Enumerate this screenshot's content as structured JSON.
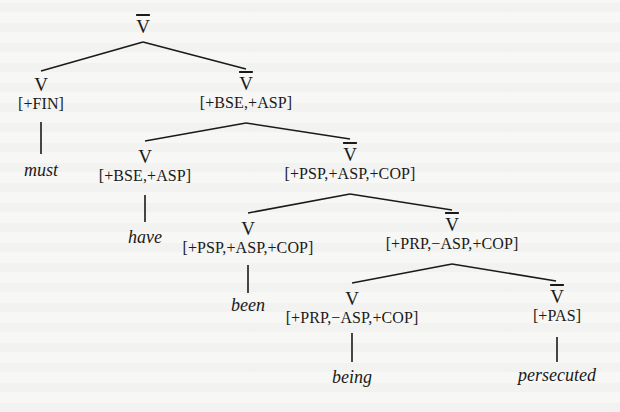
{
  "tree": {
    "root": {
      "category": "V̄",
      "bar": true
    },
    "nodes": {
      "n1": {
        "category": "V",
        "features": "[+FIN]",
        "word": "must"
      },
      "n2": {
        "category": "V̄",
        "features": "[+BSE,+ASP]"
      },
      "n3": {
        "category": "V",
        "features": "[+BSE,+ASP]",
        "word": "have"
      },
      "n4": {
        "category": "V̄",
        "features": "[+PSP,+ASP,+COP]"
      },
      "n5": {
        "category": "V",
        "features": "[+PSP,+ASP,+COP]",
        "word": "been"
      },
      "n6": {
        "category": "V̄",
        "features": "[+PRP,−ASP,+COP]"
      },
      "n7": {
        "category": "V",
        "features": "[+PRP,−ASP,+COP]",
        "word": "being"
      },
      "n8": {
        "category": "V̄",
        "features": "[+PAS]",
        "word": "persecuted"
      }
    },
    "labels": {
      "root_cat": "V",
      "n1_cat": "V",
      "n2_cat": "V",
      "n3_cat": "V",
      "n4_cat": "V",
      "n5_cat": "V",
      "n6_cat": "V",
      "n7_cat": "V",
      "n8_cat": "V"
    }
  }
}
